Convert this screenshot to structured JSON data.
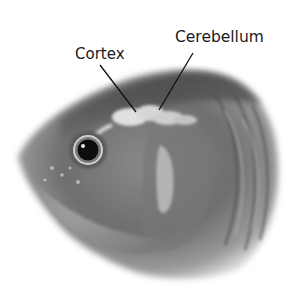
{
  "diagram": {
    "labels": [
      {
        "id": "cortex",
        "text": "Cortex"
      },
      {
        "id": "cerebellum",
        "text": "Cerebellum"
      }
    ],
    "colors": {
      "background": "#ffffff",
      "label_text": "#1a1a1a",
      "leader_line": "#111111"
    }
  }
}
